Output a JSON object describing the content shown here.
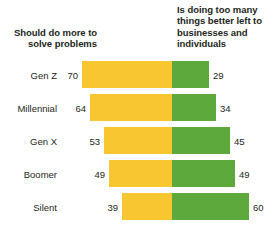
{
  "chart_data": {
    "type": "bar",
    "subtype": "diverging-stacked-bar",
    "title": "",
    "subtitle": "",
    "xlabel": "",
    "ylabel": "",
    "grid": false,
    "legend_position": "top",
    "categories": [
      "Gen Z",
      "Millennial",
      "Gen X",
      "Boomer",
      "Silent"
    ],
    "series": [
      {
        "name": "Should do more to solve problems",
        "color": "#f8c630",
        "direction": "left",
        "values": [
          70,
          64,
          53,
          49,
          39
        ]
      },
      {
        "name": "Is doing too many things better left to businesses and individuals",
        "color": "#5da93c",
        "direction": "right",
        "values": [
          29,
          34,
          45,
          49,
          60
        ]
      }
    ],
    "units": "percent",
    "xlim": [
      -70,
      60
    ],
    "pixels_per_unit": 1.283,
    "center_x_px": 172
  },
  "headers": {
    "left": "Should do more to solve problems",
    "right": "Is doing too many things better left to businesses and individuals"
  },
  "rows": [
    {
      "label": "Gen Z",
      "left_value": "70",
      "right_value": "29"
    },
    {
      "label": "Millennial",
      "left_value": "64",
      "right_value": "34"
    },
    {
      "label": "Gen X",
      "left_value": "53",
      "right_value": "45"
    },
    {
      "label": "Boomer",
      "left_value": "49",
      "right_value": "49"
    },
    {
      "label": "Silent",
      "left_value": "39",
      "right_value": "60"
    }
  ],
  "colors": {
    "left_bar": "#f8c630",
    "right_bar": "#5da93c",
    "background": "#ffffff",
    "text": "#231f20"
  }
}
